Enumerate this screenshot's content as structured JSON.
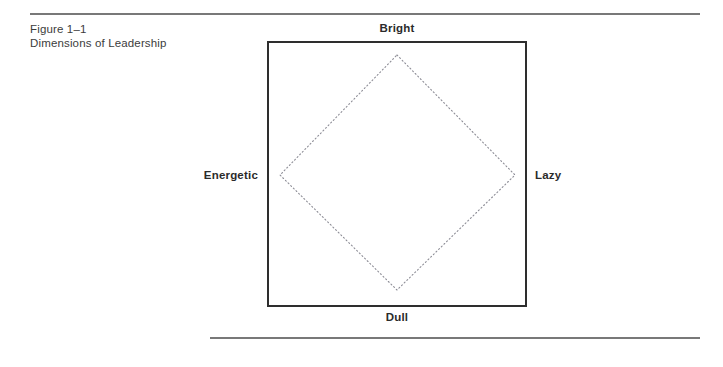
{
  "figure": {
    "caption_lines": [
      "Figure 1–1",
      "Dimensions of Leadership"
    ],
    "labels": {
      "top": "Bright",
      "bottom": "Dull",
      "left": "Energetic",
      "right": "Lazy"
    },
    "colors": {
      "rule": "#787878",
      "frame_border": "#2e2e2e",
      "diamond_stroke": "#8d8d96",
      "caption_text": "#3c3c3c",
      "label_text": "#2b2b2b",
      "background": "#ffffff"
    },
    "geometry": {
      "frame": {
        "x": 267,
        "y": 41,
        "width": 260,
        "height": 266
      },
      "diamond_vertices": {
        "top": [
          397,
          55
        ],
        "right": [
          515,
          175
        ],
        "bottom": [
          397,
          290
        ],
        "left": [
          280,
          175
        ]
      },
      "diamond_line_style": "dotted"
    }
  }
}
